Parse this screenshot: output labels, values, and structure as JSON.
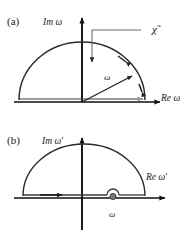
{
  "figure": {
    "type": "complex-plane-contour-diagram",
    "background_color": "#ffffff",
    "ink_color": "#1a1a1a",
    "axis_color": "#111111",
    "contour_color": "#333333",
    "secondary_arrow_color": "#9a9a9a"
  },
  "panel_a": {
    "tag": "(a)",
    "y_axis_label": "Im ω",
    "x_axis_label": "Re ω",
    "radius_label": "ω",
    "annotation_label": "χ̃",
    "contour": {
      "shape": "closed semicircle in upper half plane",
      "arc_direction": "counterclockwise",
      "arc_arrowheads": 2,
      "baseline": "double line along real axis",
      "baseline_arrow_direction": "right"
    },
    "radius_arrow": {
      "from": "origin",
      "direction": "up-right",
      "arrowhead": "at arc"
    }
  },
  "panel_b": {
    "tag": "(b)",
    "y_axis_label": "Im ω′",
    "x_axis_label": "Re ω′",
    "pole_label": "ω",
    "contour": {
      "shape": "closed semicircle in upper half plane with small indentation over pole",
      "arc_direction": "counterclockwise",
      "baseline": "double line along real axis",
      "baseline_arrow_direction": "right",
      "indentation": "small semicircular bump above pole on real axis"
    },
    "pole": {
      "marker": "filled dot",
      "position": "on real axis, right of origin"
    }
  }
}
